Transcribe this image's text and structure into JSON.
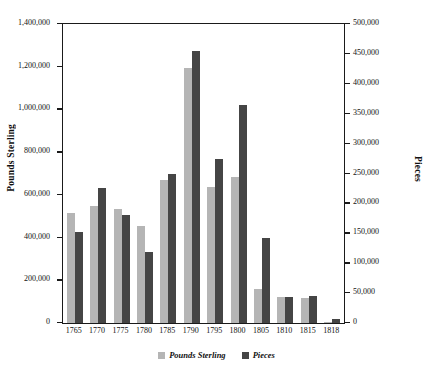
{
  "chart_data": {
    "type": "bar",
    "title": "",
    "xlabel": "",
    "ylabel": "Pounds Sterling",
    "y2label": "Pieces",
    "grid": false,
    "legend_position": "bottom",
    "categories": [
      "1765",
      "1770",
      "1775",
      "1780",
      "1785",
      "1790",
      "1795",
      "1800",
      "1805",
      "1810",
      "1815",
      "1818"
    ],
    "ylim": [
      0,
      1400000
    ],
    "y2lim": [
      0,
      500000
    ],
    "yticks": [
      "0",
      "200,000",
      "400,000",
      "600,000",
      "800,000",
      "1,000,000",
      "1,200,000",
      "1,400,000"
    ],
    "y2ticks": [
      "0",
      "50,000",
      "100,000",
      "150,000",
      "200,000",
      "250,000",
      "300,000",
      "350,000",
      "400,000",
      "450,000",
      "500,000"
    ],
    "series": [
      {
        "name": "Pounds Sterling",
        "axis": "left",
        "color": "#b5b5b5",
        "values": [
          515000,
          550000,
          535000,
          455000,
          670000,
          1195000,
          635000,
          685000,
          160000,
          120000,
          115000,
          5000
        ]
      },
      {
        "name": "Pieces",
        "axis": "right",
        "color": "#454545",
        "values": [
          153000,
          225000,
          180000,
          118000,
          250000,
          455000,
          275000,
          365000,
          143000,
          44000,
          45000,
          6000
        ]
      }
    ]
  },
  "axes": {
    "left_title": "Pounds Sterling",
    "right_title": "Pieces",
    "left_ticks": [
      {
        "label": "1,400,000",
        "value": 1400000
      },
      {
        "label": "1,200,000",
        "value": 1200000
      },
      {
        "label": "1,000,000",
        "value": 1000000
      },
      {
        "label": "800,000",
        "value": 800000
      },
      {
        "label": "600,000",
        "value": 600000
      },
      {
        "label": "400,000",
        "value": 400000
      },
      {
        "label": "200,000",
        "value": 200000
      },
      {
        "label": "0",
        "value": 0
      }
    ],
    "right_ticks": [
      {
        "label": "500,000",
        "value": 500000
      },
      {
        "label": "450,000",
        "value": 450000
      },
      {
        "label": "400,000",
        "value": 400000
      },
      {
        "label": "350,000",
        "value": 350000
      },
      {
        "label": "300,000",
        "value": 300000
      },
      {
        "label": "250,000",
        "value": 250000
      },
      {
        "label": "200,000",
        "value": 200000
      },
      {
        "label": "150,000",
        "value": 150000
      },
      {
        "label": "100,000",
        "value": 100000
      },
      {
        "label": "50,000",
        "value": 50000
      },
      {
        "label": "0",
        "value": 0
      }
    ]
  },
  "legend": {
    "items": [
      {
        "label": "Pounds Sterling",
        "color": "#b5b5b5"
      },
      {
        "label": "Pieces",
        "color": "#454545"
      }
    ]
  }
}
